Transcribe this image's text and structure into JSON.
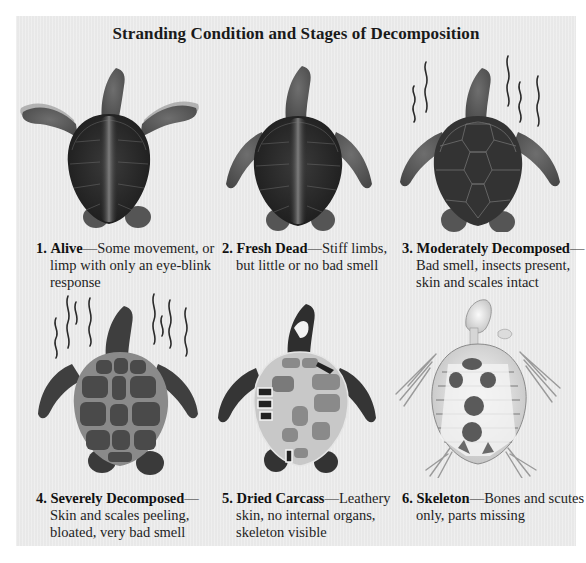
{
  "title": "Stranding Condition and Stages of Decomposition",
  "colors": {
    "panel_bg": "#ececec",
    "text": "#1e1e1e",
    "shell_dark": "#2f2f2f",
    "skin": "#5a5a5a",
    "bone": "#e6e6e6"
  },
  "stages": [
    {
      "number": "1.",
      "name": "Alive",
      "dash": "—",
      "description": "Some movement, or limp with only an eye-blink response",
      "icon": "turtle-alive-icon"
    },
    {
      "number": "2.",
      "name": "Fresh Dead",
      "dash": "—",
      "description": "Stiff limbs, but little or no bad smell",
      "icon": "turtle-fresh-dead-icon"
    },
    {
      "number": "3.",
      "name": "Moderately Decomposed",
      "dash": "—",
      "description": "Bad smell, insects present, skin and scales intact",
      "icon": "turtle-moderately-decomposed-icon"
    },
    {
      "number": "4.",
      "name": "Severely Decomposed",
      "dash": "—",
      "description": "Skin and scales peeling, bloated, very bad smell",
      "icon": "turtle-severely-decomposed-icon"
    },
    {
      "number": "5.",
      "name": "Dried Carcass",
      "dash": "—",
      "description": "Leathery skin, no internal organs, skeleton visible",
      "icon": "turtle-dried-carcass-icon"
    },
    {
      "number": "6.",
      "name": "Skeleton",
      "dash": "—",
      "description": "Bones and scutes only, parts missing",
      "icon": "turtle-skeleton-icon"
    }
  ]
}
